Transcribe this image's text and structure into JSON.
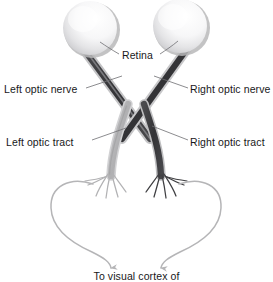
{
  "figure": {
    "background_color": "#ffffff",
    "width": 273,
    "height": 282
  },
  "labels": {
    "retina": "Retina",
    "left_optic_nerve": "Left optic nerve",
    "right_optic_nerve": "Right optic nerve",
    "left_optic_tract": "Left optic tract",
    "right_optic_tract": "Right optic tract",
    "to_visual_cortex": "To visual cortex of"
  },
  "colors": {
    "text": "#18181a",
    "leader_line": "#6e6e72",
    "left_pathway_light": "#b9b9bb",
    "left_pathway_mid": "#a6a6a8",
    "right_pathway_dark": "#3a3a3c",
    "right_pathway_mid": "#555557",
    "eye_fill_light": "#fbfbfb",
    "eye_fill_mid": "#e6e6e8",
    "eye_shadow": "#b4b4b6",
    "radiation_loop": "#b5b5b7"
  },
  "structures": [
    {
      "name": "left-eye",
      "kind": "eyeball",
      "center_x": 90,
      "center_y": 28,
      "radius": 27,
      "shading": "sphere, highlight upper-right, shadow lower-left"
    },
    {
      "name": "right-eye",
      "kind": "eyeball",
      "center_x": 180,
      "center_y": 26,
      "radius": 27,
      "shading": "sphere, highlight upper-right, shadow lower-left"
    },
    {
      "name": "left-optic-nerve",
      "kind": "nerve",
      "shade": "dark",
      "from": "left eye",
      "to": "optic chiasm",
      "note": "runs from left eye down-right to chiasm"
    },
    {
      "name": "right-optic-nerve",
      "kind": "nerve",
      "shade": "dark",
      "from": "right eye",
      "to": "optic chiasm",
      "note": "runs from right eye down-left to chiasm"
    },
    {
      "name": "optic-chiasm",
      "kind": "crossing",
      "center_x": 136,
      "center_y": 118
    },
    {
      "name": "left-optic-tract",
      "kind": "tract",
      "shade": "light",
      "from": "optic chiasm",
      "to": "left lateral geniculate / radiations"
    },
    {
      "name": "right-optic-tract",
      "kind": "tract",
      "shade": "dark",
      "from": "optic chiasm",
      "to": "right lateral geniculate / radiations"
    },
    {
      "name": "left-optic-radiation-loop",
      "kind": "radiation",
      "terminates_with": "downward arrowhead"
    },
    {
      "name": "right-optic-radiation-loop",
      "kind": "radiation",
      "terminates_with": "downward arrowhead"
    }
  ],
  "leader_lines": [
    {
      "name": "retina-left-leader",
      "from_label": "retina",
      "to_structure": "left-eye"
    },
    {
      "name": "retina-right-leader",
      "from_label": "retina",
      "to_structure": "right-eye"
    },
    {
      "name": "left-optic-nerve-leader",
      "from_label": "left_optic_nerve",
      "to_structure": "left-optic-nerve"
    },
    {
      "name": "right-optic-nerve-leader",
      "from_label": "right_optic_nerve",
      "to_structure": "right-optic-nerve"
    },
    {
      "name": "left-optic-tract-leader",
      "from_label": "left_optic_tract",
      "to_structure": "left-optic-tract"
    },
    {
      "name": "right-optic-tract-leader",
      "from_label": "right_optic_tract",
      "to_structure": "right-optic-tract"
    }
  ]
}
